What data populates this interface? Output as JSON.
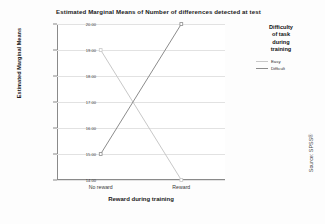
{
  "chart_data": {
    "type": "line",
    "title": "Estimated Marginal Means of Number of differences detected at test",
    "xlabel": "Reward during training",
    "ylabel": "Estimated Marginal Means",
    "categories": [
      "No reward",
      "Reward"
    ],
    "ylim": [
      14.0,
      20.0
    ],
    "yticks": [
      "14.00",
      "15.00",
      "16.00",
      "17.00",
      "18.00",
      "19.00",
      "20.00"
    ],
    "ytick_values": [
      14.0,
      15.0,
      16.0,
      17.0,
      18.0,
      19.0,
      20.0
    ],
    "grid": true,
    "legend_position": "right",
    "legend_title": "Difficulty of task during training",
    "series": [
      {
        "name": "Easy",
        "values": [
          19.0,
          14.0
        ],
        "color": "#c8c8c8"
      },
      {
        "name": "Difficult",
        "values": [
          15.0,
          20.0
        ],
        "color": "#8c8c8c"
      }
    ]
  },
  "legend": {
    "title_lines": [
      "Difficulty",
      "of task",
      "during",
      "training"
    ],
    "entries": [
      {
        "label": "Easy",
        "color": "#c8c8c8"
      },
      {
        "label": "Difficult",
        "color": "#8c8c8c"
      }
    ]
  },
  "footer": {
    "source": "Source: SPSS®"
  }
}
